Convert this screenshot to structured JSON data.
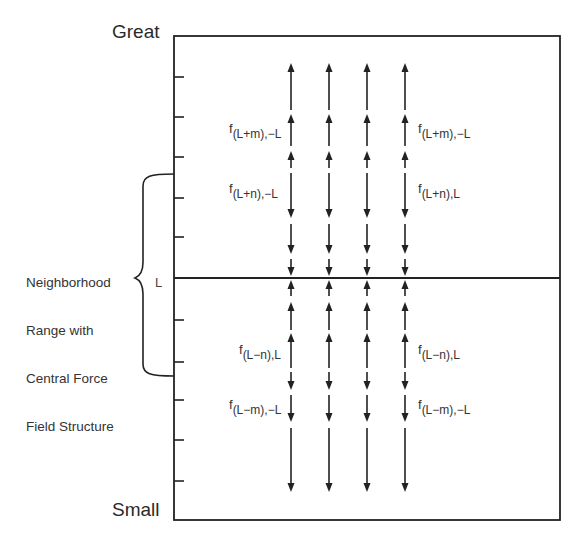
{
  "axis": {
    "top_label": "Great",
    "bottom_label": "Small"
  },
  "brace": {
    "label_lines": [
      "Neighborhood",
      "Range with",
      "Central Force",
      "Field Structure"
    ],
    "center_label": "L"
  },
  "frame": {
    "left": 174,
    "top": 36,
    "right": 560,
    "bottom": 520,
    "center_y": 278
  },
  "ticks_y": [
    77,
    117,
    157,
    198,
    237,
    320,
    362,
    400,
    440,
    481
  ],
  "columns_x": [
    291,
    329,
    367,
    405
  ],
  "arrows": [
    {
      "dir": "up",
      "from": 110,
      "to": 63
    },
    {
      "dir": "up",
      "from": 146,
      "to": 114
    },
    {
      "dir": "up",
      "from": 168,
      "to": 151
    },
    {
      "dir": "down",
      "from": 173,
      "to": 218
    },
    {
      "dir": "down",
      "from": 224,
      "to": 254
    },
    {
      "dir": "down",
      "from": 259,
      "to": 276
    },
    {
      "dir": "up",
      "from": 296,
      "to": 280
    },
    {
      "dir": "up",
      "from": 330,
      "to": 302
    },
    {
      "dir": "up",
      "from": 368,
      "to": 333
    },
    {
      "dir": "down",
      "from": 372,
      "to": 390
    },
    {
      "dir": "down",
      "from": 395,
      "to": 422
    },
    {
      "dir": "down",
      "from": 428,
      "to": 492
    }
  ],
  "force_labels": {
    "left": [
      {
        "f": "f",
        "sub": "(L+m),−L",
        "x": 229,
        "y": 122
      },
      {
        "f": "f",
        "sub": "(L+n),−L",
        "x": 229,
        "y": 182
      },
      {
        "f": "f",
        "sub": "(L−n),L",
        "x": 239,
        "y": 343
      },
      {
        "f": "f",
        "sub": "(L−m),−L",
        "x": 229,
        "y": 398
      }
    ],
    "right": [
      {
        "f": "f",
        "sub": "(L+m),−L",
        "x": 418,
        "y": 122
      },
      {
        "f": "f",
        "sub": "(L+n),L",
        "x": 418,
        "y": 182
      },
      {
        "f": "f",
        "sub": "(L−n),L",
        "x": 418,
        "y": 343
      },
      {
        "f": "f",
        "sub": "(L−m),−L",
        "x": 418,
        "y": 398
      }
    ]
  },
  "colors": {
    "line": "#222222",
    "text": "#2a2a2a"
  }
}
